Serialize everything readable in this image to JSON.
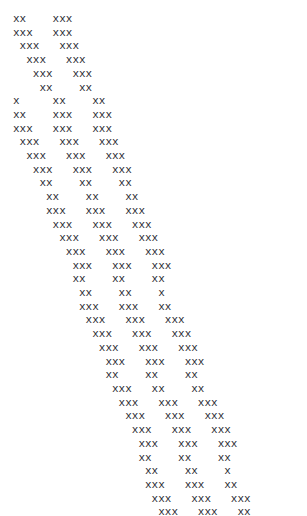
{
  "document": {
    "type": "ascii-art",
    "title": "",
    "character": "x",
    "text_color": "#2b2b33",
    "background_color": "#ffffff",
    "font_size_px": 11,
    "line_height_px": 13.7,
    "columns": 44,
    "rows": 35,
    "description": "Monospace ASCII art of repeating diagonal x-character clusters cascading from upper-left to lower-right",
    "lines": [
      "xx    xxx",
      "xxx   xxx",
      " xxx   xxx",
      "  xxx   xxx",
      "   xxx   xxx",
      "    xx    xx",
      "x     xx    xx",
      "xx    xxx   xxx",
      "xxx   xxx   xxx",
      " xxx   xxx   xxx",
      "  xxx   xxx   xxx",
      "   xxx   xxx   xxx",
      "    xx    xx    xx",
      "     xx    xx    xx",
      "     xxx   xxx   xxx",
      "      xxx   xxx   xxx",
      "       xxx   xxx   xxx",
      "        xxx   xxx   xxx",
      "         xxx   xxx   xxx",
      "         xx    xx    xx",
      "          xx    xx    x",
      "          xxx   xxx   xx",
      "           xxx   xxx   xxx",
      "            xxx   xxx   xxx",
      "             xxx   xxx   xxx",
      "              xxx   xxx   xxx",
      "              xx    xx    xx",
      "               xxx   xx    xx",
      "                xxx   xxx   xxx",
      "                 xxx   xxx   xxx",
      "                  xxx   xxx   xxx",
      "                   xxx   xxx   xxx",
      "                   xx    xx    xx",
      "                    xx    xx    x",
      "                    xxx   xxx   xx",
      "                     xxx   xxx   xxx",
      "                      xxx   xxx   xx",
      "                       xxx   xxx   x",
      "                       xx    xx",
      "                        xxx   xx",
      "                         xxx   xxx",
      "                          xxx   xx"
    ]
  }
}
